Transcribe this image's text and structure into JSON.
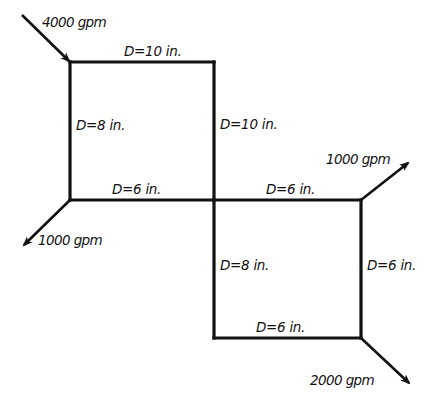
{
  "diagram": {
    "colors": {
      "line": "#111111",
      "background": "#ffffff"
    },
    "pipes": [
      {
        "id": "top-left-horizontal",
        "label": "D=10 in."
      },
      {
        "id": "left-vertical",
        "label": "D=8 in."
      },
      {
        "id": "center-upper-vertical",
        "label": "D=10 in."
      },
      {
        "id": "middle-left-horizontal",
        "label": "D=6 in."
      },
      {
        "id": "middle-right-horizontal",
        "label": "D=6 in."
      },
      {
        "id": "center-lower-vertical",
        "label": "D=8 in."
      },
      {
        "id": "right-vertical",
        "label": "D=6 in."
      },
      {
        "id": "bottom-horizontal",
        "label": "D=6 in."
      }
    ],
    "flows": [
      {
        "id": "inflow-top-left",
        "label": "4000 gpm",
        "direction": "in"
      },
      {
        "id": "outflow-left",
        "label": "1000 gpm",
        "direction": "out"
      },
      {
        "id": "outflow-right-upper",
        "label": "1000 gpm",
        "direction": "out"
      },
      {
        "id": "outflow-bottom-right",
        "label": "2000 gpm",
        "direction": "out"
      }
    ]
  }
}
